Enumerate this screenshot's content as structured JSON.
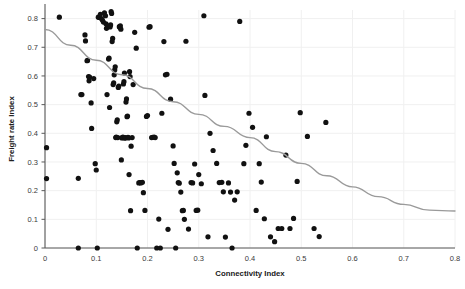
{
  "chart_data": {
    "type": "scatter",
    "title": "",
    "xlabel": "Connectivity Index",
    "ylabel": "Freight rate Index",
    "xlim": [
      0,
      0.8
    ],
    "ylim": [
      0,
      0.83
    ],
    "grid": true,
    "legend": false,
    "xticks": [
      0,
      0.1,
      0.2,
      0.3,
      0.4,
      0.5,
      0.6,
      0.7,
      0.8
    ],
    "xticklabels": [
      "0",
      "0.1",
      "0.2",
      "0.3",
      "0.4",
      "0.5",
      "0.6",
      "0.7",
      "0.8"
    ],
    "yticks": [
      0,
      0.1,
      0.2,
      0.3,
      0.4,
      0.5,
      0.6,
      0.7,
      0.8
    ],
    "yticklabels": [
      "0",
      "0.1",
      "0.2",
      "0.3",
      "0.4",
      "0.5",
      "0.6",
      "0.7",
      "0.8"
    ],
    "marker": "circle",
    "marker_color": "#111111",
    "marker_size": 2.6,
    "trendline": {
      "type": "quadratic",
      "color": "#9a9a9a",
      "description": "Downward curving fit from about 0.76 at x=0 to about 0.13 at x=0.8, flattening near x=0.75",
      "points": [
        [
          0.0,
          0.762
        ],
        [
          0.05,
          0.707
        ],
        [
          0.1,
          0.655
        ],
        [
          0.15,
          0.604
        ],
        [
          0.2,
          0.556
        ],
        [
          0.25,
          0.51
        ],
        [
          0.3,
          0.466
        ],
        [
          0.35,
          0.424
        ],
        [
          0.4,
          0.385
        ],
        [
          0.45,
          0.336
        ],
        [
          0.5,
          0.295
        ],
        [
          0.55,
          0.252
        ],
        [
          0.6,
          0.213
        ],
        [
          0.65,
          0.179
        ],
        [
          0.7,
          0.152
        ],
        [
          0.75,
          0.132
        ],
        [
          0.8,
          0.129
        ]
      ]
    },
    "points": [
      [
        0.003,
        0.35
      ],
      [
        0.003,
        0.242
      ],
      [
        0.028,
        0.805
      ],
      [
        0.065,
        0.0
      ],
      [
        0.065,
        0.243
      ],
      [
        0.07,
        0.535
      ],
      [
        0.072,
        0.535
      ],
      [
        0.078,
        0.743
      ],
      [
        0.079,
        0.722
      ],
      [
        0.082,
        0.653
      ],
      [
        0.083,
        0.654
      ],
      [
        0.085,
        0.598
      ],
      [
        0.086,
        0.583
      ],
      [
        0.087,
        0.596
      ],
      [
        0.09,
        0.506
      ],
      [
        0.091,
        0.417
      ],
      [
        0.095,
        0.591
      ],
      [
        0.098,
        0.294
      ],
      [
        0.1,
        0.272
      ],
      [
        0.102,
        0.0
      ],
      [
        0.104,
        0.805
      ],
      [
        0.106,
        0.804
      ],
      [
        0.108,
        0.815
      ],
      [
        0.11,
        0.8
      ],
      [
        0.112,
        0.795
      ],
      [
        0.114,
        0.788
      ],
      [
        0.116,
        0.82
      ],
      [
        0.118,
        0.81
      ],
      [
        0.119,
        0.782
      ],
      [
        0.12,
        0.766
      ],
      [
        0.121,
        0.535
      ],
      [
        0.122,
        0.775
      ],
      [
        0.124,
        0.659
      ],
      [
        0.125,
        0.662
      ],
      [
        0.126,
        0.49
      ],
      [
        0.127,
        0.771
      ],
      [
        0.128,
        0.778
      ],
      [
        0.129,
        0.824
      ],
      [
        0.13,
        0.818
      ],
      [
        0.131,
        0.72
      ],
      [
        0.132,
        0.731
      ],
      [
        0.133,
        0.57
      ],
      [
        0.134,
        0.576
      ],
      [
        0.135,
        0.604
      ],
      [
        0.136,
        0.621
      ],
      [
        0.137,
        0.632
      ],
      [
        0.138,
        0.385
      ],
      [
        0.139,
        0.387
      ],
      [
        0.14,
        0.44
      ],
      [
        0.141,
        0.447
      ],
      [
        0.142,
        0.385
      ],
      [
        0.143,
        0.56
      ],
      [
        0.144,
        0.565
      ],
      [
        0.145,
        0.772
      ],
      [
        0.146,
        0.77
      ],
      [
        0.147,
        0.775
      ],
      [
        0.148,
        0.763
      ],
      [
        0.149,
        0.307
      ],
      [
        0.15,
        0.384
      ],
      [
        0.151,
        0.385
      ],
      [
        0.152,
        0.387
      ],
      [
        0.153,
        0.572
      ],
      [
        0.154,
        0.58
      ],
      [
        0.155,
        0.61
      ],
      [
        0.156,
        0.383
      ],
      [
        0.157,
        0.385
      ],
      [
        0.158,
        0.509
      ],
      [
        0.159,
        0.52
      ],
      [
        0.16,
        0.458
      ],
      [
        0.161,
        0.46
      ],
      [
        0.162,
        0.386
      ],
      [
        0.163,
        0.384
      ],
      [
        0.164,
        0.256
      ],
      [
        0.165,
        0.615
      ],
      [
        0.166,
        0.598
      ],
      [
        0.167,
        0.13
      ],
      [
        0.168,
        0.355
      ],
      [
        0.17,
        0.385
      ],
      [
        0.172,
        0.57
      ],
      [
        0.175,
        0.752
      ],
      [
        0.178,
        0.697
      ],
      [
        0.18,
        0.0
      ],
      [
        0.183,
        0.227
      ],
      [
        0.185,
        0.228
      ],
      [
        0.187,
        0.227
      ],
      [
        0.19,
        0.229
      ],
      [
        0.192,
        0.193
      ],
      [
        0.195,
        0.131
      ],
      [
        0.198,
        0.459
      ],
      [
        0.2,
        0.462
      ],
      [
        0.203,
        0.77
      ],
      [
        0.205,
        0.772
      ],
      [
        0.208,
        0.385
      ],
      [
        0.21,
        0.386
      ],
      [
        0.213,
        0.387
      ],
      [
        0.215,
        0.385
      ],
      [
        0.218,
        0.0
      ],
      [
        0.222,
        0.101
      ],
      [
        0.225,
        0.0
      ],
      [
        0.228,
        0.47
      ],
      [
        0.232,
        0.72
      ],
      [
        0.235,
        0.604
      ],
      [
        0.238,
        0.606
      ],
      [
        0.24,
        0.065
      ],
      [
        0.245,
        0.519
      ],
      [
        0.25,
        0.356
      ],
      [
        0.252,
        0.295
      ],
      [
        0.255,
        0.0
      ],
      [
        0.258,
        0.262
      ],
      [
        0.26,
        0.228
      ],
      [
        0.262,
        0.226
      ],
      [
        0.265,
        0.195
      ],
      [
        0.268,
        0.13
      ],
      [
        0.27,
        0.131
      ],
      [
        0.272,
        0.1
      ],
      [
        0.275,
        0.721
      ],
      [
        0.28,
        0.066
      ],
      [
        0.285,
        0.228
      ],
      [
        0.288,
        0.227
      ],
      [
        0.292,
        0.293
      ],
      [
        0.295,
        0.131
      ],
      [
        0.298,
        0.132
      ],
      [
        0.3,
        0.256
      ],
      [
        0.305,
        0.224
      ],
      [
        0.31,
        0.81
      ],
      [
        0.312,
        0.532
      ],
      [
        0.318,
        0.039
      ],
      [
        0.322,
        0.4
      ],
      [
        0.328,
        0.34
      ],
      [
        0.335,
        0.295
      ],
      [
        0.34,
        0.228
      ],
      [
        0.345,
        0.229
      ],
      [
        0.348,
        0.196
      ],
      [
        0.352,
        0.038
      ],
      [
        0.358,
        0.227
      ],
      [
        0.362,
        0.195
      ],
      [
        0.365,
        0.0
      ],
      [
        0.37,
        0.167
      ],
      [
        0.375,
        0.196
      ],
      [
        0.38,
        0.79
      ],
      [
        0.388,
        0.294
      ],
      [
        0.392,
        0.358
      ],
      [
        0.398,
        0.47
      ],
      [
        0.405,
        0.421
      ],
      [
        0.412,
        0.131
      ],
      [
        0.418,
        0.294
      ],
      [
        0.422,
        0.23
      ],
      [
        0.428,
        0.102
      ],
      [
        0.432,
        0.388
      ],
      [
        0.44,
        0.039
      ],
      [
        0.448,
        0.022
      ],
      [
        0.455,
        0.068
      ],
      [
        0.462,
        0.068
      ],
      [
        0.47,
        0.324
      ],
      [
        0.478,
        0.068
      ],
      [
        0.485,
        0.103
      ],
      [
        0.492,
        0.232
      ],
      [
        0.498,
        0.472
      ],
      [
        0.512,
        0.389
      ],
      [
        0.525,
        0.068
      ],
      [
        0.535,
        0.04
      ],
      [
        0.548,
        0.438
      ]
    ],
    "n_points": 160
  },
  "axis": {
    "x_title": "Connectivity Index",
    "y_title": "Freight rate Index"
  }
}
